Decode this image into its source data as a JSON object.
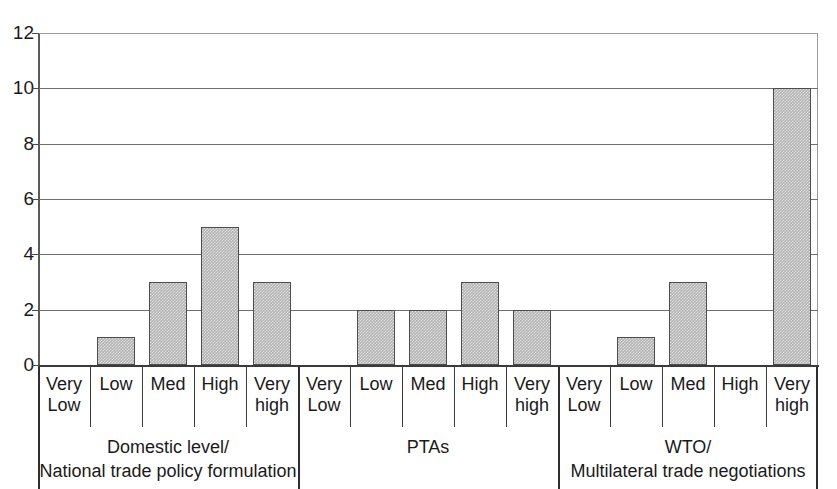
{
  "chart_data": {
    "type": "bar",
    "title": "",
    "subtitle": "",
    "xlabel": "",
    "ylabel": "",
    "ylim": [
      0,
      12
    ],
    "ytick_step": 2,
    "ytick_labels": [
      "12",
      "10",
      "8",
      "6",
      "4",
      "2",
      "0"
    ],
    "ytick_values": [
      12,
      10,
      8,
      6,
      4,
      2,
      0
    ],
    "grid": true,
    "grid_axis": "y",
    "legend": false,
    "legend_position": "none",
    "bar_color": "#b2b2b2",
    "bar_border_color": "#4d4d4d",
    "axis_color": "#3a3a3a",
    "categories": [
      "Very Low",
      "Low",
      "Med",
      "High",
      "Very high",
      "Very Low",
      "Low",
      "Med",
      "High",
      "Very high",
      "Very Low",
      "Low",
      "Med",
      "High",
      "Very high"
    ],
    "values": [
      0,
      1,
      3,
      5,
      3,
      0,
      2,
      2,
      3,
      2,
      0,
      1,
      3,
      0,
      10
    ],
    "groups": [
      {
        "label": "Domestic level/\nNational trade policy formulation",
        "label_line1": "Domestic level/",
        "label_line2": "National trade policy formulation",
        "categories": [
          "Very Low",
          "Low",
          "Med",
          "High",
          "Very high"
        ],
        "values": [
          0,
          1,
          3,
          5,
          3
        ]
      },
      {
        "label": "PTAs",
        "label_line1": "PTAs",
        "label_line2": "",
        "categories": [
          "Very Low",
          "Low",
          "Med",
          "High",
          "Very high"
        ],
        "values": [
          0,
          2,
          2,
          3,
          2
        ]
      },
      {
        "label": "WTO/\nMultilateral trade negotiations",
        "label_line1": "WTO/",
        "label_line2": "Multilateral trade negotiations",
        "categories": [
          "Very Low",
          "Low",
          "Med",
          "High",
          "Very high"
        ],
        "values": [
          0,
          1,
          3,
          0,
          10
        ]
      }
    ],
    "category_labels_wrapped": [
      {
        "line1": "Very",
        "line2": "Low"
      },
      {
        "line1": "Low",
        "line2": ""
      },
      {
        "line1": "Med",
        "line2": ""
      },
      {
        "line1": "High",
        "line2": ""
      },
      {
        "line1": "Very",
        "line2": "high"
      }
    ]
  }
}
